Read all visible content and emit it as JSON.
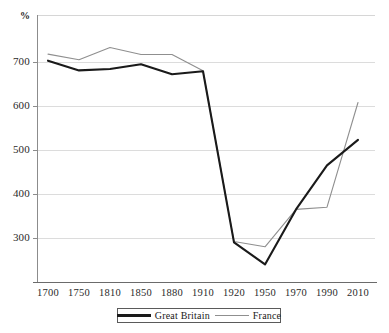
{
  "chart_data": {
    "type": "line",
    "title": "",
    "xlabel": "",
    "ylabel": "%",
    "unit_label": "%",
    "grid": true,
    "legend_position": "bottom",
    "ylim": [
      220,
      760
    ],
    "yticks": [
      700,
      600,
      500,
      400,
      300
    ],
    "ytick_labels": [
      "700",
      "600",
      "500",
      "400",
      "300"
    ],
    "categories": [
      "1700",
      "1750",
      "1810",
      "1850",
      "1880",
      "1910",
      "1920",
      "1950",
      "1970",
      "1990",
      "2010"
    ],
    "series": [
      {
        "name": "Great Britain",
        "color": "#1a1a1a",
        "values": [
          703,
          681,
          684,
          695,
          672,
          679,
          290,
          240,
          365,
          465,
          523
        ]
      },
      {
        "name": "France",
        "color": "#8f8f8f",
        "values": [
          718,
          705,
          733,
          717,
          717,
          680,
          292,
          280,
          365,
          370,
          608
        ]
      }
    ]
  },
  "legend": {
    "items": [
      {
        "label": "Great Britain",
        "swatch": "thick-black-line"
      },
      {
        "label": "France",
        "swatch": "thin-gray-line"
      }
    ]
  },
  "colors": {
    "great_britain": "#1a1a1a",
    "france": "#8f8f8f",
    "gridline": "#dcdcdc",
    "axis": "#8c8c8c",
    "background": "#ffffff"
  }
}
